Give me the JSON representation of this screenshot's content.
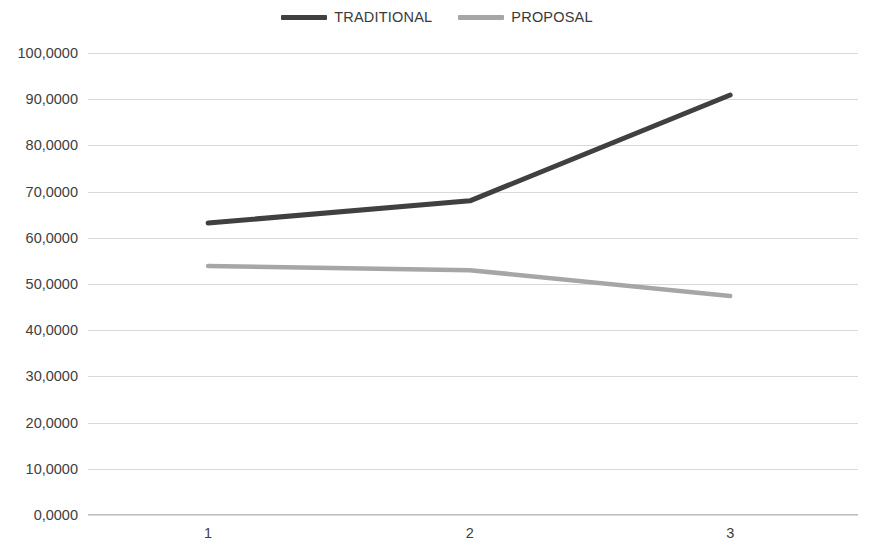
{
  "chart_data": {
    "type": "line",
    "title": "",
    "xlabel": "",
    "ylabel": "",
    "categories": [
      "1",
      "2",
      "3"
    ],
    "series": [
      {
        "name": "TRADITIONAL",
        "color": "#404040",
        "values": [
          63.2,
          68.0,
          90.9
        ]
      },
      {
        "name": "PROPOSAL",
        "color": "#a6a6a6",
        "values": [
          53.9,
          53.0,
          47.4
        ]
      }
    ],
    "ylim": [
      0,
      100
    ],
    "ytick_labels": [
      "100,0000",
      "90,0000",
      "80,0000",
      "70,0000",
      "60,0000",
      "50,0000",
      "40,0000",
      "30,0000",
      "20,0000",
      "10,0000",
      "0,0000"
    ],
    "ytick_values": [
      100,
      90,
      80,
      70,
      60,
      50,
      40,
      30,
      20,
      10,
      0
    ],
    "grid": true,
    "grid_color": "#d9d9d9",
    "legend_position": "top",
    "background_color": "#ffffff"
  },
  "legend": {
    "entries": [
      {
        "label": "TRADITIONAL",
        "color": "#404040"
      },
      {
        "label": "PROPOSAL",
        "color": "#a6a6a6"
      }
    ]
  }
}
